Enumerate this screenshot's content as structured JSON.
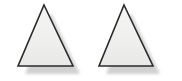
{
  "figure": {
    "name": "two-triangles-figure",
    "type": "vector-illustration",
    "width": 182,
    "height": 81,
    "background_color": "#ffffff",
    "alt_text": "Two identical shaded triangles side by side with drop shadows",
    "style": {
      "fill_color": "#f0f0ef",
      "fill_color_inner": "#ededec",
      "stroke_color": "#2b2b2b",
      "stroke_width": 1.6,
      "shadow_color": "#c9c9c9",
      "shadow_color_soft": "#dcdcdc",
      "shadow_offset_x": 7,
      "shadow_offset_y": 8
    },
    "shapes": [
      {
        "id": "triangle-left",
        "label": "Triangle 1",
        "kind": "triangle",
        "orientation": "apex-up",
        "points": "44,5 73,66 18,66",
        "apex": {
          "x": 44,
          "y": 5
        },
        "base_left": {
          "x": 18,
          "y": 66
        },
        "base_right": {
          "x": 73,
          "y": 66
        }
      },
      {
        "id": "triangle-right",
        "label": "Triangle 2",
        "kind": "triangle",
        "orientation": "apex-up",
        "points": "124,5 153,66 99,66",
        "apex": {
          "x": 124,
          "y": 5
        },
        "base_left": {
          "x": 99,
          "y": 66
        },
        "base_right": {
          "x": 153,
          "y": 66
        }
      }
    ]
  }
}
